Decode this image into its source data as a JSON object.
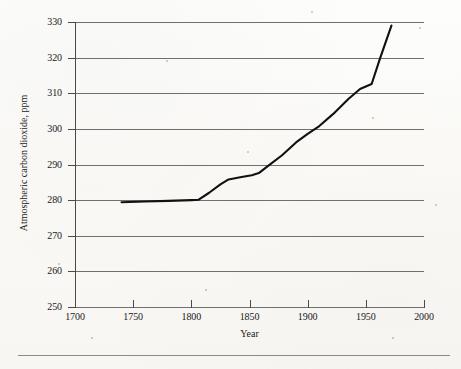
{
  "chart_data": {
    "type": "line",
    "title": "",
    "xlabel": "Year",
    "ylabel": "Atmospheric carbon dioxide, ppm",
    "xlim": [
      1700,
      2000
    ],
    "ylim": [
      250,
      330
    ],
    "xticks": [
      1700,
      1750,
      1800,
      1850,
      1900,
      1950,
      2000
    ],
    "yticks": [
      250,
      260,
      270,
      280,
      290,
      300,
      310,
      320,
      330
    ],
    "grid": "horizontal",
    "legend": "none",
    "series": [
      {
        "name": "Atmospheric carbon dioxide",
        "color": "#111111",
        "x": [
          1740,
          1760,
          1780,
          1800,
          1806,
          1815,
          1825,
          1832,
          1842,
          1852,
          1858,
          1866,
          1878,
          1890,
          1900,
          1910,
          1922,
          1935,
          1945,
          1950,
          1955,
          1962,
          1972
        ],
        "y": [
          279.4,
          279.6,
          279.8,
          280.0,
          280.1,
          282.0,
          284.4,
          285.8,
          286.4,
          287.0,
          287.6,
          289.6,
          292.6,
          296.2,
          298.6,
          300.8,
          304.2,
          308.4,
          311.2,
          311.9,
          312.6,
          319.6,
          329.0
        ]
      }
    ]
  },
  "axes": {
    "x_title": "Year",
    "y_title": "Atmospheric carbon dioxide, ppm",
    "x_tick_labels": [
      "1700",
      "1750",
      "1800",
      "1850",
      "1900",
      "1950",
      "2000"
    ],
    "y_tick_labels": [
      "330",
      "320",
      "310",
      "300",
      "290",
      "280",
      "270",
      "260",
      "250"
    ]
  },
  "colors": {
    "data_line": "#111111",
    "gridline": "#6f6f6f",
    "axis": "#4a4a4a",
    "background": "#fbfbf9",
    "rule": "#8a8a8a"
  }
}
